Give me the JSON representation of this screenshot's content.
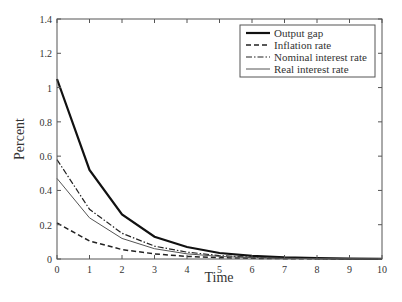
{
  "chart_data": {
    "type": "line",
    "title": "",
    "xlabel": "Time",
    "ylabel": "Percent",
    "xlim": [
      0,
      10
    ],
    "ylim": [
      0,
      1.4
    ],
    "x_ticks": [
      "0",
      "1",
      "2",
      "3",
      "4",
      "5",
      "6",
      "7",
      "8",
      "9",
      "10"
    ],
    "y_ticks": [
      "0",
      "0.2",
      "0.4",
      "0.6",
      "0.8",
      "1",
      "1.2",
      "1.4"
    ],
    "grid": false,
    "legend_position": "upper right",
    "x": [
      0,
      1,
      2,
      3,
      4,
      5,
      6,
      7,
      8,
      9,
      10
    ],
    "series": [
      {
        "name": "Output gap",
        "style": "solid-thick",
        "values": [
          1.05,
          0.52,
          0.26,
          0.13,
          0.07,
          0.035,
          0.018,
          0.009,
          0.005,
          0.002,
          0.001
        ]
      },
      {
        "name": "Inflation rate",
        "style": "dashed",
        "values": [
          0.21,
          0.105,
          0.055,
          0.03,
          0.015,
          0.008,
          0.004,
          0.002,
          0.001,
          0.0005,
          0.0002
        ]
      },
      {
        "name": "Nominal interest rate",
        "style": "dash-dot",
        "values": [
          0.58,
          0.29,
          0.15,
          0.075,
          0.04,
          0.02,
          0.01,
          0.005,
          0.0025,
          0.001,
          0.0005
        ]
      },
      {
        "name": "Real interest rate",
        "style": "solid-thin",
        "values": [
          0.47,
          0.24,
          0.12,
          0.06,
          0.03,
          0.015,
          0.008,
          0.004,
          0.002,
          0.001,
          0.0005
        ]
      }
    ]
  }
}
